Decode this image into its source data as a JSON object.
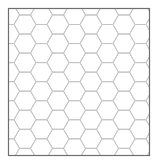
{
  "diagram": {
    "type": "hexagonal-grid",
    "orientation": "flat-top",
    "background": "#ffffff",
    "frame": {
      "x": 8.5,
      "y": 8.5,
      "width": 141,
      "height": 147,
      "stroke": "#6e6e6e",
      "stroke_width": 1.2
    },
    "grid": {
      "side": 11,
      "origin_x": 14,
      "origin_y": 24.5,
      "cols": 10,
      "rows": 9,
      "stroke": "#c4c4c4",
      "stroke_width": 1
    }
  }
}
